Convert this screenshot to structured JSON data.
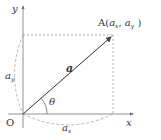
{
  "diagram": {
    "axes": {
      "x_label": "x",
      "y_label": "y",
      "origin_label": "O"
    },
    "point": {
      "label_prefix": "A(",
      "comp_x_base": "a",
      "comp_x_sub": "x",
      "separator": ", ",
      "comp_y_base": "a",
      "comp_y_sub": "y",
      "label_suffix": " )"
    },
    "vector_label": "a",
    "angle_label": "θ",
    "component_x": {
      "base": "a",
      "sub": "x"
    },
    "component_y": {
      "base": "a",
      "sub": "y"
    },
    "colors": {
      "line": "#444444",
      "dashed": "#888888",
      "text": "#333333"
    }
  }
}
